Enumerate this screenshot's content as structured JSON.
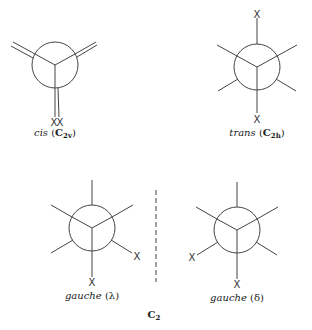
{
  "figure": {
    "substituent_label": "X",
    "molecules": [
      {
        "id": "cis",
        "name": "cis",
        "symmetry": "C",
        "symmetry_sub": "2v"
      },
      {
        "id": "trans",
        "name": "trans",
        "symmetry": "C",
        "symmetry_sub": "2h"
      },
      {
        "id": "gauche-lambda",
        "name": "gauche",
        "chirality": "(λ)"
      },
      {
        "id": "gauche-delta",
        "name": "gauche",
        "chirality": "(δ)"
      }
    ],
    "group_label": "C",
    "group_label_sub": "2",
    "line_color": "#444444"
  }
}
